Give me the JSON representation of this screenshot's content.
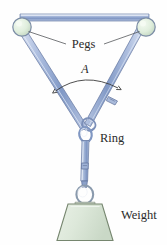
{
  "figure": {
    "background_color": "#fefefe",
    "labels": {
      "pegs": "Pegs",
      "angle": "A",
      "ring": "Ring",
      "weight": "Weight"
    },
    "colors": {
      "strap_light": "#c9d6ec",
      "strap_mid": "#9fb3d9",
      "strap_dark": "#6d84b4",
      "strap_outline": "#5f7099",
      "peg_fill": "#dfeede",
      "peg_outline": "#7f8fa8",
      "weight_fill": "#dfe8dc",
      "weight_outline": "#6f7f6d",
      "label_color": "#2b2b2b",
      "leader_color": "#55585c"
    },
    "elements": [
      {
        "name": "left-peg",
        "type": "circle",
        "cx": 22,
        "cy": 27,
        "r": 9
      },
      {
        "name": "right-peg",
        "type": "circle",
        "cx": 146,
        "cy": 27,
        "r": 9
      },
      {
        "name": "top-strap",
        "type": "strap",
        "from": "left-peg",
        "to": "right-peg"
      },
      {
        "name": "left-strap",
        "type": "strap",
        "from": "left-peg",
        "to": "ring"
      },
      {
        "name": "right-strap",
        "type": "strap",
        "from": "right-peg",
        "to": "ring"
      },
      {
        "name": "ring",
        "type": "ring",
        "cx": 86,
        "cy": 133
      },
      {
        "name": "hanging-rope",
        "type": "strap",
        "from": "ring",
        "to": "weight-ring"
      },
      {
        "name": "weight-ring",
        "type": "ring",
        "cx": 85,
        "cy": 193
      },
      {
        "name": "weight-block",
        "type": "trapezoid",
        "top_width": 32,
        "bottom_width": 56,
        "height": 42
      },
      {
        "name": "angle-arc",
        "type": "arc",
        "measures": "A"
      }
    ]
  }
}
